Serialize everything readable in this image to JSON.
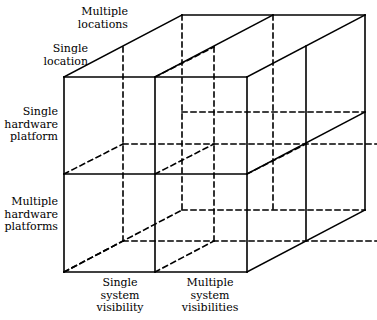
{
  "diagram": {
    "stroke_color": "#000000",
    "background_color": "#ffffff",
    "axes": [
      {
        "name": "depth-axis-locations",
        "labels": [
          "Multiple locations",
          "Single location"
        ]
      },
      {
        "name": "vertical-axis-hardware",
        "labels": [
          "Single hardware platform",
          "Multiple hardware platforms"
        ]
      },
      {
        "name": "horizontal-axis-visibility",
        "labels": [
          "Single system visibility",
          "Multiple system visibilities"
        ]
      }
    ],
    "labels": {
      "multiple_locations": {
        "line1": "Multiple",
        "line2": "locations"
      },
      "single_location": {
        "line1": "Single",
        "line2": "location"
      },
      "single_hardware_platform": {
        "line1": "Single",
        "line2": "hardware",
        "line3": "platform"
      },
      "multiple_hardware_platforms": {
        "line1": "Multiple",
        "line2": "hardware",
        "line3": "platforms"
      },
      "single_system_visibility": {
        "line1": "Single",
        "line2": "system",
        "line3": "visibility"
      },
      "multiple_system_visibilities": {
        "line1": "Multiple",
        "line2": "system",
        "line3": "visibilities"
      }
    }
  }
}
